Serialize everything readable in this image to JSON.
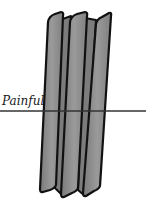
{
  "figure": {
    "label": "Painful",
    "strip_count": 3,
    "colors": {
      "strip_fill": "#8c8c8c",
      "strip_fill_dark": "#777777",
      "outline": "#111111",
      "line": "#333333",
      "background": "#ffffff"
    },
    "threshold_line_y": 111
  }
}
